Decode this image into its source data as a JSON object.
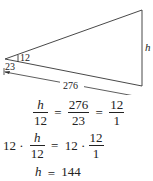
{
  "diagram": {
    "labels": {
      "height": "h",
      "small_height": "12",
      "small_base": "23",
      "large_base": "276"
    }
  },
  "equations": {
    "line1": {
      "left_num": "h",
      "left_den": "12",
      "eq1": "=",
      "mid_num": "276",
      "mid_den": "23",
      "eq2": "=",
      "right_num": "12",
      "right_den": "1"
    },
    "line2": {
      "coef_left": "12 ·",
      "left_num": "h",
      "left_den": "12",
      "eq": "=",
      "coef_right": "12 ·",
      "right_num": "12",
      "right_den": "1"
    },
    "line3": {
      "var": "h",
      "eq": "=",
      "value": "144"
    }
  }
}
